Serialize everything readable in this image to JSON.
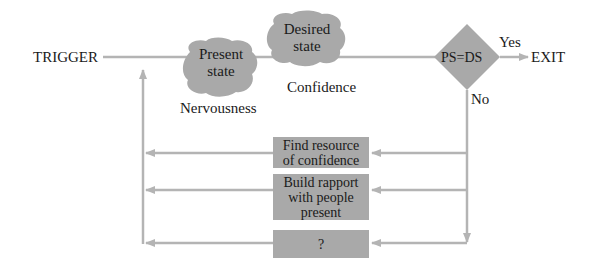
{
  "trigger": {
    "label": "TRIGGER"
  },
  "present_state": {
    "label_line1": "Present",
    "label_line2": "state",
    "caption": "Nervousness"
  },
  "desired_state": {
    "label_line1": "Desired",
    "label_line2": "state",
    "caption": "Confidence"
  },
  "decision": {
    "label": "PS=DS",
    "yes_label": "Yes",
    "no_label": "No"
  },
  "exit": {
    "label": "EXIT"
  },
  "actions": [
    {
      "label_line1": "Find resource",
      "label_line2": "of confidence",
      "label_line3": ""
    },
    {
      "label_line1": "Build rapport",
      "label_line2": "with people",
      "label_line3": "present"
    },
    {
      "label_line1": "?",
      "label_line2": "",
      "label_line3": ""
    }
  ],
  "colors": {
    "shape_fill": "#a9a9a9",
    "line": "#b4b4b4",
    "text": "#1a1a1a"
  }
}
